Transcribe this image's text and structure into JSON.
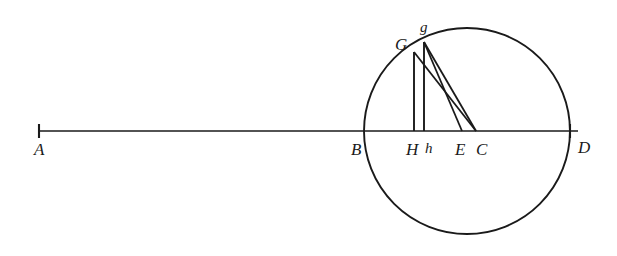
{
  "figure": {
    "background_color": "#ffffff",
    "ink_color": "#1a1a1a",
    "labels": {
      "A": "A",
      "B": "B",
      "G_upper": "G",
      "g_lower": "g",
      "H_upper": "H",
      "h_lower": "h",
      "E": "E",
      "C": "C",
      "D": "D"
    }
  },
  "chart_data": {
    "type": "diagram",
    "xlim": [
      0,
      617
    ],
    "ylim": [
      0,
      256
    ],
    "grid": false,
    "legend": null,
    "circle": {
      "center_x": 467,
      "center_y": 131,
      "radius": 103
    },
    "points": [
      {
        "name": "A",
        "x": 39,
        "y": 131,
        "label_dx": -5,
        "label_dy": 10,
        "tick": true,
        "label_case": "upper"
      },
      {
        "name": "B",
        "x": 364,
        "y": 131,
        "label_dx": -13,
        "label_dy": 10,
        "tick": false,
        "label_case": "upper"
      },
      {
        "name": "G",
        "x": 414,
        "y": 52,
        "label_dx": -19,
        "label_dy": -16,
        "tick": false,
        "label_case": "upper"
      },
      {
        "name": "g",
        "x": 424,
        "y": 42,
        "label_dx": -4,
        "label_dy": -22,
        "tick": false,
        "label_case": "lower"
      },
      {
        "name": "H",
        "x": 414,
        "y": 131,
        "label_dx": -8,
        "label_dy": 10,
        "tick": false,
        "label_case": "upper"
      },
      {
        "name": "h",
        "x": 424,
        "y": 131,
        "label_dx": 1,
        "label_dy": 10,
        "tick": false,
        "label_case": "lower"
      },
      {
        "name": "E",
        "x": 462,
        "y": 131,
        "label_dx": -7,
        "label_dy": 10,
        "tick": false,
        "label_case": "upper"
      },
      {
        "name": "C",
        "x": 476,
        "y": 131,
        "label_dx": 0,
        "label_dy": 10,
        "tick": false,
        "label_case": "upper"
      },
      {
        "name": "D",
        "x": 570,
        "y": 131,
        "label_dx": 8,
        "label_dy": 8,
        "tick": true,
        "label_case": "upper"
      }
    ],
    "baseline": {
      "from": "A",
      "to": "D",
      "x1": 39,
      "y1": 131,
      "x2": 578,
      "y2": 131,
      "description": "Horizontal line from A through B, H, h, E, C to D"
    },
    "segments": [
      {
        "from": "G",
        "to": "H",
        "x1": 414,
        "y1": 52,
        "x2": 414,
        "y2": 131,
        "kind": "vertical"
      },
      {
        "from": "g",
        "to": "h",
        "x1": 424,
        "y1": 42,
        "x2": 424,
        "y2": 131,
        "kind": "vertical"
      },
      {
        "from": "G",
        "to": "C",
        "x1": 414,
        "y1": 52,
        "x2": 476,
        "y2": 131,
        "kind": "slant"
      },
      {
        "from": "g",
        "to": "E",
        "x1": 424,
        "y1": 42,
        "x2": 462,
        "y2": 131,
        "kind": "slant"
      },
      {
        "from": "g",
        "to": "C",
        "x1": 424,
        "y1": 42,
        "x2": 476,
        "y2": 131,
        "kind": "slant"
      }
    ],
    "ticks": [
      {
        "at": "A",
        "x": 39,
        "y": 131,
        "half_height": 7
      },
      {
        "at": "D",
        "x": 570,
        "y": 131,
        "half_height": 7
      }
    ]
  }
}
